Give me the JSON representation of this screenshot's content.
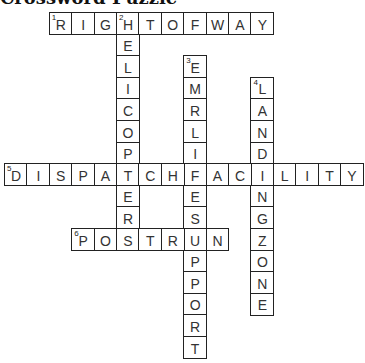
{
  "title": "Crossword Puzzle",
  "grid": {
    "origin_x": 4,
    "origin_y": 12,
    "cell_w": 22.4,
    "cell_h": 21.6
  },
  "words": [
    {
      "number": 1,
      "direction": "across",
      "answer": "RIGHTOFWAY",
      "row": 0,
      "col": 2
    },
    {
      "number": 2,
      "direction": "down",
      "answer": "HELICOPTER",
      "row": 0,
      "col": 5
    },
    {
      "number": 3,
      "direction": "down",
      "answer": "EMRLIFESUPPORT",
      "row": 2,
      "col": 8
    },
    {
      "number": 4,
      "direction": "down",
      "answer": "LANDINGZONE",
      "row": 3,
      "col": 11
    },
    {
      "number": 5,
      "direction": "across",
      "answer": "DISPATCHFACILITY",
      "row": 7,
      "col": 0
    },
    {
      "number": 6,
      "direction": "across",
      "answer": "POSTRUN",
      "row": 10,
      "col": 3
    }
  ]
}
